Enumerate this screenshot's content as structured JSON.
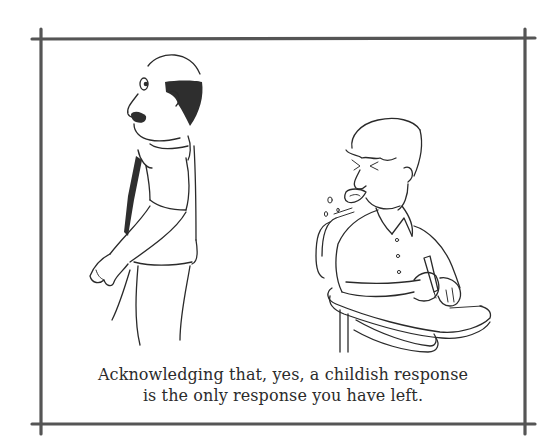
{
  "cartoon": {
    "caption_lines": [
      "Acknowledging that, yes, a childish response",
      "is the only response you have left."
    ],
    "figures": [
      "bald-man-with-mustache",
      "boy-at-school-desk-blowing-raspberry"
    ],
    "colors": {
      "background": "#ffffff",
      "ink": "#2a2a2a",
      "border": "#555555",
      "caption": "#2b2b2b"
    }
  }
}
